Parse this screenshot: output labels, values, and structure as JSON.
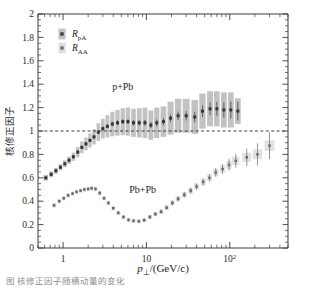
{
  "figure": {
    "title": "",
    "y_axis_label": "核修正因子",
    "x_axis_label_main": "p",
    "x_axis_label_sub": "⊥",
    "x_axis_label_rest": "/(GeV/c)",
    "caption": "图 核修正因子随横动量的变化"
  },
  "legend": {
    "position": "top-left",
    "entries": [
      {
        "name": "legend-rpa",
        "label_main": "R",
        "label_sub": "pA",
        "marker": "filled-square-with-box",
        "color": "#3c3c3c",
        "box_color": "#9a9a9a"
      },
      {
        "name": "legend-raa",
        "label_main": "R",
        "label_sub": "AA",
        "marker": "filled-square",
        "color": "#6f6f6f",
        "box_color": "#c9c9c9"
      }
    ]
  },
  "annotations": [
    {
      "text": "p+Pb",
      "x": 5.2,
      "y": 1.35
    },
    {
      "text": "Pb+Pb",
      "x": 9.0,
      "y": 0.47
    }
  ],
  "chart_data": {
    "type": "scatter",
    "title": "",
    "xlabel": "p⊥/(GeV/c)",
    "ylabel": "核修正因子",
    "xscale": "log",
    "yscale": "linear",
    "xlim": [
      0.5,
      500
    ],
    "ylim": [
      0,
      2
    ],
    "grid": false,
    "reference_lines": [
      {
        "y": 1.0,
        "style": "dashed"
      }
    ],
    "yticks": [
      0,
      0.2,
      0.4,
      0.6,
      0.8,
      1,
      1.2,
      1.4,
      1.6,
      1.8,
      2
    ],
    "yticklabels": [
      "0",
      "0.2",
      "0.4",
      "0.6",
      "0.8",
      "1",
      "1.2",
      "1.4",
      "1.6",
      "1.8",
      "2"
    ],
    "xticks": [
      1,
      10,
      100
    ],
    "xticklabels": [
      "1",
      "10",
      "10²"
    ],
    "series": [
      {
        "name": "R_pA",
        "system": "p+Pb",
        "marker": "square",
        "color": "#343434",
        "band_color": "#9c9c9c",
        "x": [
          0.62,
          0.72,
          0.82,
          0.93,
          1.05,
          1.18,
          1.33,
          1.5,
          1.68,
          1.88,
          2.1,
          2.35,
          2.65,
          3.0,
          3.4,
          3.9,
          4.5,
          5.2,
          6.0,
          7.0,
          8.2,
          9.6,
          11.3,
          13.3,
          16.0,
          19.5,
          24.0,
          30.0,
          38.0,
          47.0,
          58.0,
          70.0,
          85.0,
          103.0,
          125.0
        ],
        "y": [
          0.6,
          0.63,
          0.66,
          0.69,
          0.72,
          0.75,
          0.78,
          0.82,
          0.86,
          0.89,
          0.92,
          0.95,
          0.99,
          1.02,
          1.04,
          1.06,
          1.07,
          1.08,
          1.08,
          1.07,
          1.07,
          1.07,
          1.05,
          1.07,
          1.08,
          1.11,
          1.13,
          1.13,
          1.12,
          1.17,
          1.19,
          1.19,
          1.18,
          1.18,
          1.17
        ],
        "yerr": [
          0.012,
          0.012,
          0.012,
          0.012,
          0.013,
          0.013,
          0.013,
          0.014,
          0.014,
          0.015,
          0.015,
          0.016,
          0.017,
          0.018,
          0.018,
          0.019,
          0.02,
          0.02,
          0.021,
          0.022,
          0.023,
          0.024,
          0.026,
          0.028,
          0.03,
          0.033,
          0.036,
          0.04,
          0.045,
          0.05,
          0.055,
          0.06,
          0.066,
          0.072,
          0.08
        ],
        "sys_lo": [
          0.575,
          0.605,
          0.635,
          0.663,
          0.69,
          0.718,
          0.745,
          0.775,
          0.81,
          0.835,
          0.86,
          0.885,
          0.915,
          0.935,
          0.945,
          0.955,
          0.96,
          0.965,
          0.96,
          0.95,
          0.945,
          0.94,
          0.925,
          0.94,
          0.95,
          0.97,
          0.985,
          0.985,
          0.975,
          1.02,
          1.04,
          1.04,
          1.03,
          1.03,
          1.06
        ],
        "sys_hi": [
          0.625,
          0.655,
          0.685,
          0.717,
          0.75,
          0.782,
          0.815,
          0.865,
          0.91,
          0.945,
          0.98,
          1.015,
          1.065,
          1.105,
          1.135,
          1.165,
          1.18,
          1.195,
          1.2,
          1.19,
          1.195,
          1.2,
          1.175,
          1.2,
          1.21,
          1.25,
          1.275,
          1.275,
          1.265,
          1.32,
          1.34,
          1.34,
          1.33,
          1.33,
          1.28
        ]
      },
      {
        "name": "R_AA",
        "system": "Pb+Pb",
        "marker": "square",
        "color": "#6a6a6a",
        "band_color": "#cfcfcf",
        "x": [
          0.78,
          0.9,
          1.02,
          1.15,
          1.3,
          1.45,
          1.62,
          1.8,
          2.0,
          2.2,
          2.45,
          2.75,
          3.1,
          3.5,
          4.0,
          4.6,
          5.3,
          6.1,
          7.0,
          8.1,
          9.4,
          11.0,
          12.8,
          15.0,
          17.5,
          20.5,
          24.0,
          28.5,
          34.0,
          40.0,
          48.0,
          57.0,
          68.0,
          82.0,
          98.0,
          118.0,
          160.0,
          215.0,
          300.0
        ],
        "y": [
          0.365,
          0.4,
          0.425,
          0.45,
          0.465,
          0.48,
          0.49,
          0.5,
          0.505,
          0.51,
          0.505,
          0.47,
          0.425,
          0.385,
          0.34,
          0.3,
          0.265,
          0.24,
          0.232,
          0.228,
          0.238,
          0.265,
          0.29,
          0.31,
          0.345,
          0.385,
          0.42,
          0.455,
          0.49,
          0.525,
          0.565,
          0.6,
          0.645,
          0.675,
          0.71,
          0.745,
          0.775,
          0.8,
          0.875
        ],
        "yerr": [
          0.012,
          0.012,
          0.012,
          0.012,
          0.012,
          0.012,
          0.012,
          0.012,
          0.012,
          0.012,
          0.012,
          0.013,
          0.013,
          0.013,
          0.013,
          0.013,
          0.014,
          0.014,
          0.014,
          0.015,
          0.015,
          0.016,
          0.017,
          0.018,
          0.019,
          0.02,
          0.022,
          0.024,
          0.026,
          0.028,
          0.031,
          0.034,
          0.038,
          0.042,
          0.05,
          0.058,
          0.075,
          0.095,
          0.115
        ],
        "sys_lo": [
          0.345,
          0.382,
          0.407,
          0.432,
          0.447,
          0.462,
          0.472,
          0.482,
          0.487,
          0.49,
          0.485,
          0.45,
          0.407,
          0.367,
          0.322,
          0.283,
          0.248,
          0.224,
          0.216,
          0.212,
          0.222,
          0.248,
          0.272,
          0.291,
          0.325,
          0.364,
          0.398,
          0.432,
          0.466,
          0.5,
          0.538,
          0.572,
          0.615,
          0.643,
          0.676,
          0.709,
          0.736,
          0.758,
          0.83
        ],
        "sys_hi": [
          0.385,
          0.418,
          0.443,
          0.468,
          0.483,
          0.498,
          0.508,
          0.518,
          0.523,
          0.53,
          0.525,
          0.49,
          0.443,
          0.403,
          0.358,
          0.317,
          0.282,
          0.256,
          0.248,
          0.244,
          0.254,
          0.282,
          0.308,
          0.329,
          0.365,
          0.406,
          0.442,
          0.478,
          0.514,
          0.55,
          0.592,
          0.628,
          0.675,
          0.707,
          0.744,
          0.781,
          0.814,
          0.842,
          0.92
        ]
      }
    ]
  }
}
